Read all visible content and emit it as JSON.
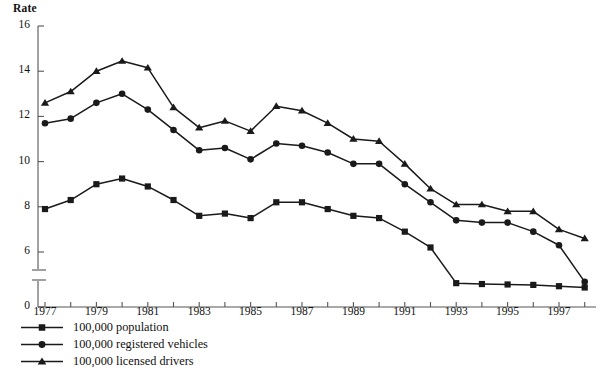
{
  "chart_data": {
    "type": "line",
    "title": "",
    "ylabel": "Rate",
    "xlabel": "",
    "grid": false,
    "legend_position": "below-left",
    "axis_break": {
      "from": 0,
      "to": 6,
      "note": "y-axis broken between 0 and 6"
    },
    "ylim": [
      0,
      16
    ],
    "yticks": [
      0,
      6,
      8,
      10,
      12,
      14,
      16
    ],
    "ytick_labels": [
      "0",
      "6",
      "8",
      "10",
      "12",
      "14",
      "16"
    ],
    "xlim": [
      1977,
      1998
    ],
    "x": [
      1977,
      1978,
      1979,
      1980,
      1981,
      1982,
      1983,
      1984,
      1985,
      1986,
      1987,
      1988,
      1989,
      1990,
      1991,
      1992,
      1993,
      1994,
      1995,
      1996,
      1997,
      1998
    ],
    "xticks": [
      1977,
      1978,
      1979,
      1980,
      1981,
      1982,
      1983,
      1984,
      1985,
      1986,
      1987,
      1988,
      1989,
      1990,
      1991,
      1992,
      1993,
      1994,
      1995,
      1996,
      1997,
      1998
    ],
    "xtick_labels": [
      "1977",
      "1979",
      "1981",
      "1983",
      "1985",
      "1987",
      "1989",
      "1991",
      "1993",
      "1995",
      "1997"
    ],
    "xtick_label_years": [
      1977,
      1979,
      1981,
      1983,
      1985,
      1987,
      1989,
      1991,
      1993,
      1995,
      1997
    ],
    "series": [
      {
        "name": "100,000 population",
        "marker": "square",
        "color": "#1a1a1a",
        "values": [
          7.9,
          8.3,
          9.0,
          9.25,
          8.9,
          8.3,
          7.6,
          7.7,
          7.5,
          8.2,
          8.2,
          7.9,
          7.6,
          7.5,
          6.9,
          6.2,
          5.5,
          5.3,
          5.2,
          5.1,
          4.8,
          4.5
        ]
      },
      {
        "name": "100,000 registered vehicles",
        "marker": "circle",
        "color": "#1a1a1a",
        "values": [
          11.7,
          11.9,
          12.6,
          13.0,
          12.3,
          11.4,
          10.5,
          10.6,
          10.1,
          10.8,
          10.7,
          10.4,
          9.9,
          9.9,
          9.0,
          8.2,
          7.4,
          7.3,
          7.3,
          6.9,
          6.3,
          5.8
        ]
      },
      {
        "name": "100,000 licensed drivers",
        "marker": "triangle",
        "color": "#1a1a1a",
        "values": [
          12.6,
          13.1,
          14.0,
          14.45,
          14.15,
          12.4,
          11.5,
          11.8,
          11.35,
          12.45,
          12.25,
          11.7,
          11.0,
          10.9,
          9.9,
          8.8,
          8.1,
          8.1,
          7.8,
          7.8,
          7.0,
          6.6
        ]
      }
    ]
  },
  "legend": {
    "items": [
      {
        "label": "100,000 population",
        "marker": "square"
      },
      {
        "label": "100,000 registered vehicles",
        "marker": "circle"
      },
      {
        "label": "100,000 licensed drivers",
        "marker": "triangle"
      }
    ]
  },
  "axis": {
    "y_title": "Rate"
  }
}
